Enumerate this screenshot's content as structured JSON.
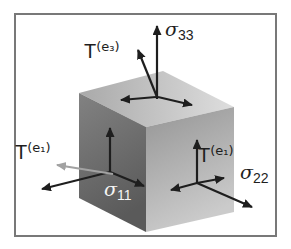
{
  "figure": {
    "type": "stress-tensor-cube-diagram",
    "labels": {
      "traction_top": {
        "base": "T",
        "sup": "(e₃)"
      },
      "traction_left": {
        "base": "T",
        "sup": "(e₁)"
      },
      "traction_right": {
        "base": "T",
        "sup": "(e₁)"
      },
      "sigma_33": {
        "base": "σ",
        "sub": "33"
      },
      "sigma_22": {
        "base": "σ",
        "sub": "22"
      },
      "sigma_11": {
        "base": "σ",
        "sub": "11"
      }
    },
    "colors": {
      "background": "#ffffff",
      "frame_border": "#787878",
      "cube_top_face_dark": "#a9a9a9",
      "cube_top_face_light": "#dedede",
      "cube_left_face_top": "#828282",
      "cube_left_face_bottom": "#5a5a5a",
      "cube_right_face_dark": "#959595",
      "cube_right_face_light": "#cbcbcb",
      "arrow": "#1e1e1e",
      "gray_arrow": "#a2a2a2",
      "label_text": "#1e1e1e",
      "label_text_on_dark": "#f5f5f5"
    }
  }
}
